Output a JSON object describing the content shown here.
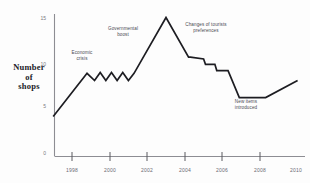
{
  "chart_data": {
    "type": "line",
    "title": "",
    "xlabel": "",
    "ylabel": "Number of shops",
    "ylabel_lines": [
      "Number",
      "of",
      "shops"
    ],
    "xlim": [
      1997,
      2010.5
    ],
    "ylim": [
      0,
      16
    ],
    "grid": false,
    "legend": "none",
    "yticks": [
      0,
      5,
      10,
      15
    ],
    "ytick_labels": [
      "0",
      "5",
      "10",
      "15"
    ],
    "xticks": [
      1998,
      2000,
      2002,
      2004,
      2006,
      2008,
      2010
    ],
    "xtick_labels": [
      "1998",
      "2000",
      "2002",
      "2004",
      "2006",
      "2008",
      "2010"
    ],
    "line_color": "#1d1d22",
    "axis_color": "#8d8d93",
    "series": [
      {
        "name": "Number of shops",
        "x": [
          1997.0,
          1998.8,
          1999.2,
          1999.5,
          1999.8,
          2000.1,
          2000.4,
          2000.7,
          2001.0,
          2001.3,
          2003.0,
          2004.2,
          2004.3,
          2005.0,
          2005.1,
          2005.6,
          2005.7,
          2006.3,
          2006.4,
          2006.9,
          2008.3,
          2010.0
        ],
        "values": [
          4.0,
          8.8,
          8.0,
          8.9,
          8.0,
          8.9,
          8.0,
          8.9,
          8.0,
          8.8,
          15.0,
          10.6,
          10.6,
          10.4,
          9.8,
          9.8,
          9.1,
          9.1,
          8.6,
          6.1,
          6.1,
          8.0
        ]
      }
    ],
    "annotations": [
      {
        "id": "economic",
        "text_lines": [
          "Economic",
          "crisis"
        ],
        "x": 1999.2,
        "y": 11.0
      },
      {
        "id": "government",
        "text_lines": [
          "Governmental",
          "boost"
        ],
        "x": 2000.6,
        "y": 13.6
      },
      {
        "id": "tourists",
        "text_lines": [
          "Changes of tourists",
          "preferences"
        ],
        "x": 2004.6,
        "y": 14.1
      },
      {
        "id": "newitems",
        "text_lines": [
          "New items",
          "introduced"
        ],
        "x": 2006.8,
        "y": 3.8
      }
    ]
  }
}
